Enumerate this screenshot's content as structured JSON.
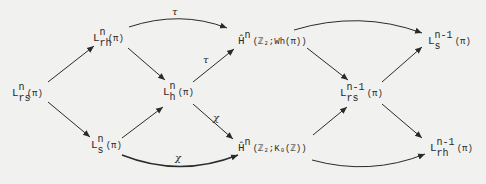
{
  "diagram": {
    "nodes": {
      "Lrs_n": {
        "base": "L",
        "sup": "n",
        "sub": "rs",
        "arg": "(π)"
      },
      "Lrh_n": {
        "base": "L",
        "sup": "n",
        "sub": "rh",
        "arg": "(π)"
      },
      "Ls_n": {
        "base": "L",
        "sup": "n",
        "sub": "s",
        "arg": "(π)"
      },
      "Lh_n": {
        "base": "L",
        "sup": "n",
        "sub": "h",
        "arg": "(π)"
      },
      "H_Wh": {
        "base": "Ĥ",
        "sup": "n",
        "sub": "",
        "arg": "(ℤ₂;Wh(π))"
      },
      "H_K0": {
        "base": "Ĥ",
        "sup": "n",
        "sub": "",
        "arg": "(ℤ₂;K₀(ℤ))"
      },
      "Lrs_n1": {
        "base": "L",
        "sup": "n-1",
        "sub": "rs",
        "arg": "(π)"
      },
      "Ls_n1": {
        "base": "L",
        "sup": "n-1",
        "sub": "s",
        "arg": "(π)"
      },
      "Lrh_n1": {
        "base": "L",
        "sup": "n-1",
        "sub": "rh",
        "arg": "(π)"
      }
    },
    "arrow_labels": {
      "tau_top": "τ",
      "tau_mid": "τ",
      "chi_mid": "χ",
      "chi_bottom": "χ"
    },
    "colors": {
      "background": "#f1f1ef",
      "ink": "#2a2a2a"
    }
  }
}
